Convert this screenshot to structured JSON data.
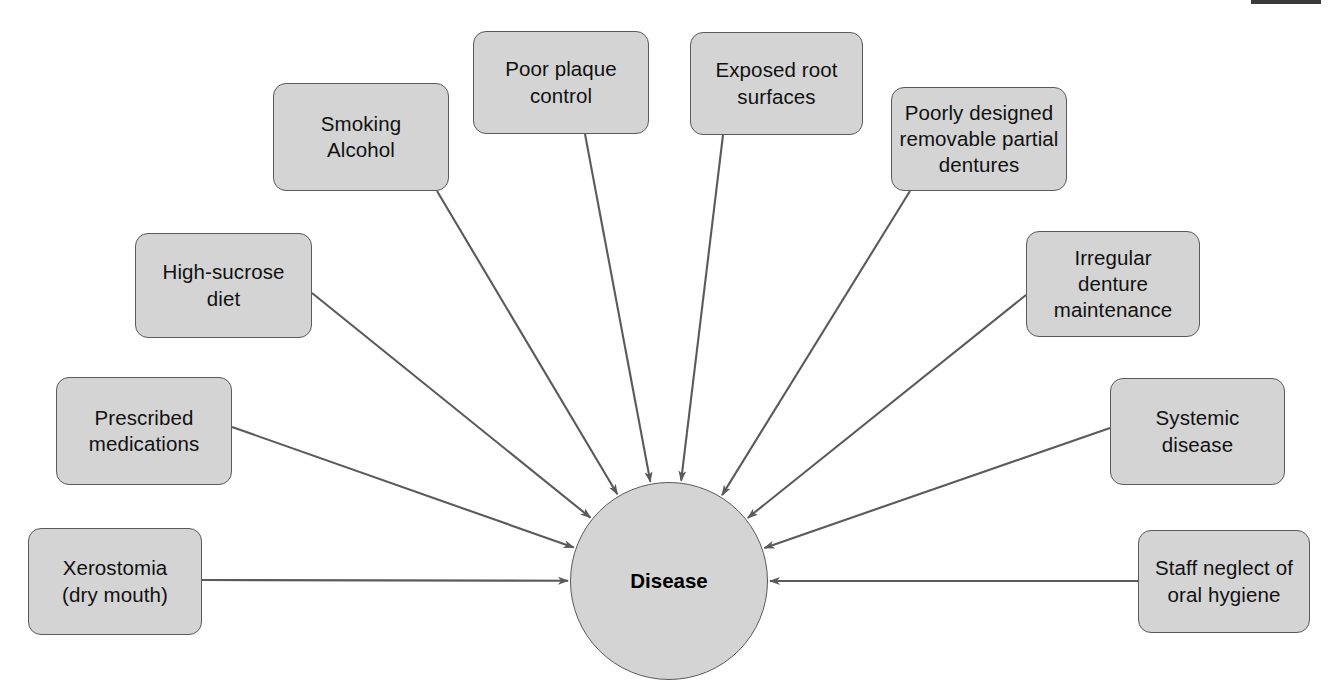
{
  "diagram": {
    "type": "fishbone-cause-and-effect",
    "center": {
      "label": "Disease",
      "shape": "circle",
      "fill": "#d4d4d4",
      "stroke": "#5a5a5a",
      "cx": 669,
      "cy": 581,
      "r": 99
    },
    "style": {
      "node_fill": "#d4d4d4",
      "node_stroke": "#5a5a5a",
      "edge_color": "#5a5a5a",
      "text_color": "#111111",
      "background": "#fefefe"
    },
    "artifact": {
      "name": "scan-edge-bar",
      "color": "#3a3a3a"
    },
    "nodes": [
      {
        "id": "smoking-alcohol",
        "label": "Smoking\nAlcohol",
        "x": 273,
        "y": 83,
        "w": 176,
        "h": 108,
        "anchor_x": 437,
        "anchor_y": 191
      },
      {
        "id": "poor-plaque-control",
        "label": "Poor plaque\ncontrol",
        "x": 473,
        "y": 31,
        "w": 176,
        "h": 103,
        "anchor_x": 585,
        "anchor_y": 134
      },
      {
        "id": "exposed-root-surfaces",
        "label": "Exposed root\nsurfaces",
        "x": 690,
        "y": 32,
        "w": 173,
        "h": 103,
        "anchor_x": 723,
        "anchor_y": 135
      },
      {
        "id": "poorly-designed-removable-partial-dentures",
        "label": "Poorly designed\nremovable partial\ndentures",
        "x": 891,
        "y": 87,
        "w": 176,
        "h": 104,
        "anchor_x": 910,
        "anchor_y": 191
      },
      {
        "id": "irregular-denture-maintenance",
        "label": "Irregular\ndenture\nmaintenance",
        "x": 1026,
        "y": 231,
        "w": 174,
        "h": 106,
        "anchor_x": 1026,
        "anchor_y": 295
      },
      {
        "id": "high-sucrose-diet",
        "label": "High-sucrose\ndiet",
        "x": 135,
        "y": 233,
        "w": 177,
        "h": 105,
        "anchor_x": 312,
        "anchor_y": 293
      },
      {
        "id": "prescribed-medications",
        "label": "Prescribed\nmedications",
        "x": 56,
        "y": 377,
        "w": 176,
        "h": 108,
        "anchor_x": 232,
        "anchor_y": 427
      },
      {
        "id": "systemic-disease",
        "label": "Systemic\ndisease",
        "x": 1110,
        "y": 378,
        "w": 175,
        "h": 107,
        "anchor_x": 1110,
        "anchor_y": 428
      },
      {
        "id": "xerostomia",
        "label": "Xerostomia\n(dry mouth)",
        "x": 28,
        "y": 528,
        "w": 174,
        "h": 107,
        "anchor_x": 202,
        "anchor_y": 580
      },
      {
        "id": "staff-neglect-of-oral-hygiene",
        "label": "Staff neglect of\noral hygiene",
        "x": 1138,
        "y": 530,
        "w": 172,
        "h": 103,
        "anchor_x": 1138,
        "anchor_y": 581
      }
    ]
  }
}
